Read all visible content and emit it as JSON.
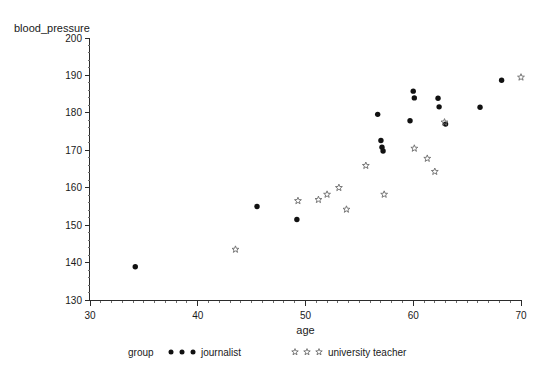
{
  "chart_data": {
    "type": "scatter",
    "title": "",
    "xlabel": "age",
    "ylabel": "blood_pressure",
    "xlim": [
      30,
      70
    ],
    "ylim": [
      130,
      200
    ],
    "x_ticks": [
      30,
      40,
      50,
      60,
      70
    ],
    "y_ticks": [
      130,
      140,
      150,
      160,
      170,
      180,
      190,
      200
    ],
    "x_minor_step": 1,
    "y_minor_step": 2,
    "grid": false,
    "legend_position": "bottom",
    "legend_title": "group",
    "series": [
      {
        "name": "journalist",
        "marker": "filled-circle",
        "color": "#111111",
        "points": [
          [
            34.2,
            138.9
          ],
          [
            45.5,
            155.0
          ],
          [
            49.2,
            151.5
          ],
          [
            56.7,
            179.6
          ],
          [
            57.0,
            172.6
          ],
          [
            57.1,
            170.8
          ],
          [
            57.2,
            169.8
          ],
          [
            59.7,
            177.9
          ],
          [
            60.0,
            185.8
          ],
          [
            60.1,
            184.0
          ],
          [
            62.3,
            183.9
          ],
          [
            62.4,
            181.6
          ],
          [
            63.0,
            177.0
          ],
          [
            66.2,
            181.5
          ],
          [
            68.2,
            188.7
          ]
        ]
      },
      {
        "name": "university teacher",
        "marker": "star",
        "color": "#7a7a7a",
        "points": [
          [
            43.5,
            143.5
          ],
          [
            49.3,
            156.5
          ],
          [
            51.2,
            156.8
          ],
          [
            52.0,
            158.2
          ],
          [
            53.1,
            160.0
          ],
          [
            53.8,
            154.2
          ],
          [
            55.6,
            165.9
          ],
          [
            57.3,
            158.2
          ],
          [
            60.1,
            170.5
          ],
          [
            61.3,
            167.8
          ],
          [
            62.0,
            164.3
          ],
          [
            62.9,
            177.5
          ],
          [
            70.0,
            189.5
          ]
        ]
      }
    ]
  },
  "axes": {
    "x_title": "age",
    "y_title": "blood_pressure",
    "x_tick_labels": [
      "30",
      "40",
      "50",
      "60",
      "70"
    ],
    "y_tick_labels": [
      "130",
      "140",
      "150",
      "160",
      "170",
      "180",
      "190",
      "200"
    ]
  },
  "legend": {
    "group_label": "group",
    "entries": [
      {
        "label": "journalist",
        "marker": "filled-circle"
      },
      {
        "label": "university teacher",
        "marker": "star"
      }
    ]
  },
  "colors": {
    "journalist": "#111111",
    "teacher": "#7a7a7a",
    "axis": "#2b2b2b",
    "background": "#ffffff"
  }
}
